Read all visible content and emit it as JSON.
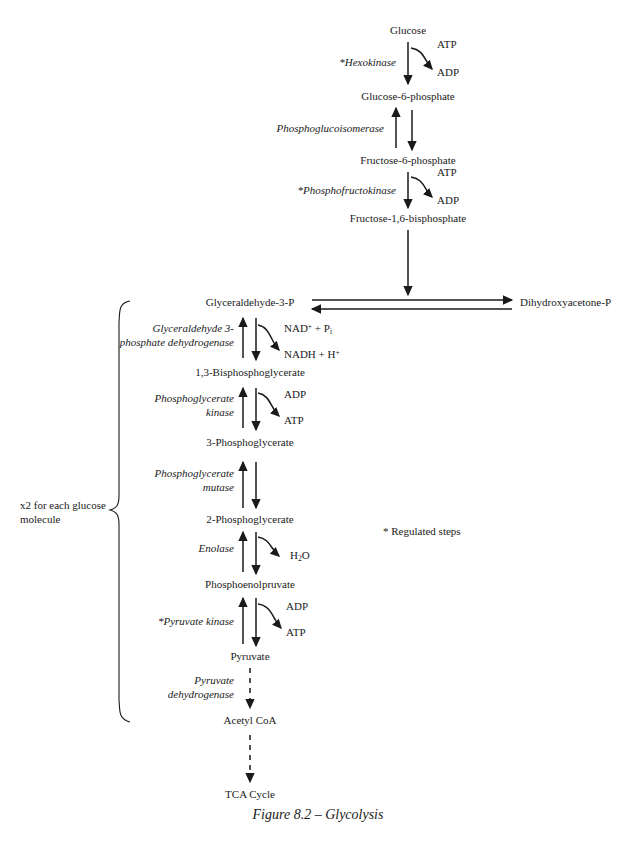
{
  "figure": {
    "caption": "Figure 8.2 – Glycolysis",
    "footnote": "* Regulated steps",
    "bracket_note_line1": "x2 for each glucose",
    "bracket_note_line2": "molecule"
  },
  "metabolites": [
    {
      "id": "glucose",
      "label": "Glucose"
    },
    {
      "id": "g6p",
      "label": "Glucose-6-phosphate"
    },
    {
      "id": "f6p",
      "label": "Fructose-6-phosphate"
    },
    {
      "id": "f16bp",
      "label": "Fructose-1,6-bisphosphate"
    },
    {
      "id": "g3p",
      "label": "Glyceraldehyde-3-P"
    },
    {
      "id": "dhap",
      "label": "Dihydroxyacetone-P"
    },
    {
      "id": "bpg",
      "label": "1,3-Bisphosphoglycerate"
    },
    {
      "id": "pg3",
      "label": "3-Phosphoglycerate"
    },
    {
      "id": "pg2",
      "label": "2-Phosphoglycerate"
    },
    {
      "id": "pep",
      "label": "Phosphoenolpruvate"
    },
    {
      "id": "pyruvate",
      "label": "Pyruvate"
    },
    {
      "id": "acetylcoa",
      "label": "Acetyl CoA"
    },
    {
      "id": "tca",
      "label": "TCA Cycle"
    }
  ],
  "enzymes": [
    {
      "id": "hexokinase",
      "line1": "*Hexokinase",
      "line2": ""
    },
    {
      "id": "phosphoglucoisomerase",
      "line1": "Phosphoglucoisomerase",
      "line2": ""
    },
    {
      "id": "phosphofructokinase",
      "line1": "*Phosphofructokinase",
      "line2": ""
    },
    {
      "id": "gapdh",
      "line1": "Glyceraldehyde 3-",
      "line2": "phosphate dehydrogenase"
    },
    {
      "id": "pgk",
      "line1": "Phosphoglycerate",
      "line2": "kinase"
    },
    {
      "id": "pgm",
      "line1": "Phosphoglycerate",
      "line2": "mutase"
    },
    {
      "id": "enolase",
      "line1": "Enolase",
      "line2": ""
    },
    {
      "id": "pyruvate-kinase",
      "line1": "*Pyruvate kinase",
      "line2": ""
    },
    {
      "id": "pdh",
      "line1": "Pyruvate",
      "line2": "dehydrogenase"
    }
  ],
  "cofactors": [
    {
      "id": "atp-1",
      "label": "ATP"
    },
    {
      "id": "adp-1",
      "label": "ADP"
    },
    {
      "id": "atp-2",
      "label": "ATP"
    },
    {
      "id": "adp-2",
      "label": "ADP"
    },
    {
      "id": "nad-pi",
      "label": "NAD+ + Pi"
    },
    {
      "id": "nadh-h",
      "label": "NADH + H+"
    },
    {
      "id": "adp-3",
      "label": "ADP"
    },
    {
      "id": "atp-3",
      "label": "ATP"
    },
    {
      "id": "water",
      "label": "H2O"
    },
    {
      "id": "adp-4",
      "label": "ADP"
    },
    {
      "id": "atp-4",
      "label": "ATP"
    }
  ],
  "colors": {
    "ink": "#1a1a1a",
    "background": "#ffffff"
  },
  "pathway": {
    "name": "Glycolysis",
    "steps": [
      {
        "from": "Glucose",
        "to": "Glucose-6-phosphate",
        "enzyme": "*Hexokinase",
        "consumes": "ATP",
        "produces": "ADP",
        "reversible": false
      },
      {
        "from": "Glucose-6-phosphate",
        "to": "Fructose-6-phosphate",
        "enzyme": "Phosphoglucoisomerase",
        "consumes": "",
        "produces": "",
        "reversible": true
      },
      {
        "from": "Fructose-6-phosphate",
        "to": "Fructose-1,6-bisphosphate",
        "enzyme": "*Phosphofructokinase",
        "consumes": "ATP",
        "produces": "ADP",
        "reversible": false
      },
      {
        "from": "Fructose-1,6-bisphosphate",
        "to": "Glyceraldehyde-3-P",
        "enzyme": "",
        "consumes": "",
        "produces": "",
        "reversible": false
      },
      {
        "from": "Glyceraldehyde-3-P",
        "to": "Dihydroxyacetone-P",
        "enzyme": "",
        "consumes": "",
        "produces": "",
        "reversible": true
      },
      {
        "from": "Glyceraldehyde-3-P",
        "to": "1,3-Bisphosphoglycerate",
        "enzyme": "Glyceraldehyde 3-phosphate dehydrogenase",
        "consumes": "NAD+ + Pi",
        "produces": "NADH + H+",
        "reversible": true
      },
      {
        "from": "1,3-Bisphosphoglycerate",
        "to": "3-Phosphoglycerate",
        "enzyme": "Phosphoglycerate kinase",
        "consumes": "ADP",
        "produces": "ATP",
        "reversible": true
      },
      {
        "from": "3-Phosphoglycerate",
        "to": "2-Phosphoglycerate",
        "enzyme": "Phosphoglycerate mutase",
        "consumes": "",
        "produces": "",
        "reversible": true
      },
      {
        "from": "2-Phosphoglycerate",
        "to": "Phosphoenolpruvate",
        "enzyme": "Enolase",
        "consumes": "",
        "produces": "H2O",
        "reversible": true
      },
      {
        "from": "Phosphoenolpruvate",
        "to": "Pyruvate",
        "enzyme": "*Pyruvate kinase",
        "consumes": "ADP",
        "produces": "ATP",
        "reversible": true
      },
      {
        "from": "Pyruvate",
        "to": "Acetyl CoA",
        "enzyme": "Pyruvate dehydrogenase",
        "consumes": "",
        "produces": "",
        "reversible": false
      },
      {
        "from": "Acetyl CoA",
        "to": "TCA Cycle",
        "enzyme": "",
        "consumes": "",
        "produces": "",
        "reversible": false
      }
    ]
  }
}
